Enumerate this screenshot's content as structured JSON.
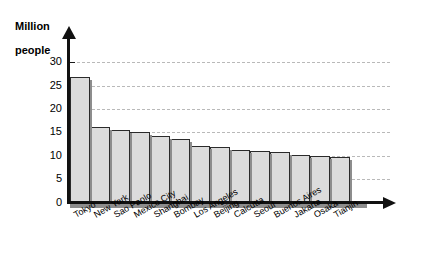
{
  "chart_data": {
    "type": "bar",
    "title": "",
    "subtitle": "",
    "xlabel": "",
    "ylabel": "Million people",
    "ylim": [
      0,
      32
    ],
    "yticks": [
      0,
      5,
      10,
      15,
      20,
      25,
      30
    ],
    "grid": true,
    "legend": null,
    "categories": [
      "Tokyo",
      "New York",
      "Sao Paolo",
      "Mexico City",
      "Shanghai",
      "Bombay",
      "Los Angeles",
      "Beijing",
      "Calcutta",
      "Seoul",
      "Buenos Aires",
      "Jakarta",
      "Osaka",
      "Tianjin"
    ],
    "values": [
      26.8,
      16.2,
      15.5,
      15.0,
      14.2,
      13.5,
      12.0,
      11.8,
      11.3,
      11.0,
      10.7,
      10.2,
      10.0,
      9.8
    ],
    "bar_color": "#dcdcdc",
    "bar_border_color": "#2b2b2b",
    "shadow_color": "#8d8d8d",
    "gridline_color": "#b9b9b9",
    "axis_color": "#111111"
  },
  "axis": {
    "y_title_line1": "Million",
    "y_title_line2": "people"
  }
}
